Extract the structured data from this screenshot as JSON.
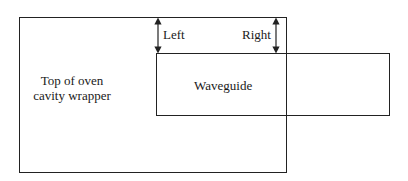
{
  "diagram": {
    "outer_box": {
      "label_line1": "Top of oven",
      "label_line2": "cavity wrapper"
    },
    "inner_box": {
      "label": "Waveguide"
    },
    "left_dimension": {
      "label": "Left"
    },
    "right_dimension": {
      "label": "Right"
    },
    "colors": {
      "stroke": "#222222",
      "text": "#1a1a1a",
      "background": "#ffffff"
    }
  }
}
